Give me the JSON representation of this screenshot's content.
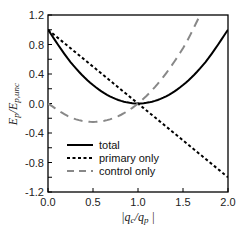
{
  "chart_data": {
    "type": "line",
    "title": "",
    "xlabel": "|q_c/q_p|",
    "ylabel": "E_p/E_p,unc",
    "xlim": [
      0.0,
      2.0
    ],
    "ylim": [
      -1.2,
      1.2
    ],
    "xticks": [
      "0.0",
      "0.5",
      "1.0",
      "1.5",
      "2.0"
    ],
    "yticks": [
      "1.2",
      "0.8",
      "0.4",
      "0.0",
      "-0.4",
      "-0.8",
      "-1.2"
    ],
    "grid": false,
    "legend_position": "lower-left inside",
    "series": [
      {
        "name": "total",
        "style": "solid",
        "color": "#000000",
        "x": [
          0.0,
          0.25,
          0.5,
          0.75,
          1.0,
          1.25,
          1.5,
          1.75,
          2.0
        ],
        "values": [
          1.0,
          0.5625,
          0.25,
          0.0625,
          0.0,
          0.0625,
          0.25,
          0.5625,
          1.0
        ]
      },
      {
        "name": "primary only",
        "style": "dotted",
        "color": "#000000",
        "x": [
          0.0,
          0.5,
          1.0,
          1.5,
          2.0
        ],
        "values": [
          1.0,
          0.5,
          0.0,
          -0.5,
          -1.0
        ]
      },
      {
        "name": "control only",
        "style": "dashed",
        "color": "#808080",
        "x": [
          0.0,
          0.25,
          0.5,
          0.75,
          1.0,
          1.25,
          1.5,
          1.69
        ],
        "values": [
          0.0,
          -0.1875,
          -0.25,
          -0.1875,
          0.0,
          0.3125,
          0.75,
          1.2
        ]
      }
    ]
  },
  "axis": {
    "x_label_main": "|q",
    "x_label_sub1": "c",
    "x_label_mid": "/q",
    "x_label_sub2": "p",
    "x_label_end": " |",
    "y_label_main": "E",
    "y_label_sub1": "p",
    "y_label_mid": "/E",
    "y_label_sub2": "p,unc"
  },
  "legend": {
    "items": [
      {
        "label": "total"
      },
      {
        "label": "primary only"
      },
      {
        "label": "control only"
      }
    ]
  }
}
